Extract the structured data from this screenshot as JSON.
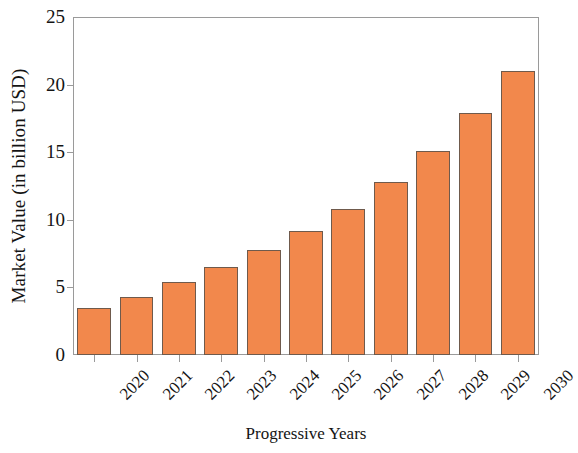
{
  "chart_data": {
    "type": "bar",
    "title": "",
    "xlabel": "Progressive Years",
    "ylabel": "Market Value (in billion USD)",
    "categories": [
      "2020",
      "2021",
      "2022",
      "2023",
      "2024",
      "2025",
      "2026",
      "2027",
      "2028",
      "2029",
      "2030"
    ],
    "values": [
      3.5,
      4.3,
      5.4,
      6.5,
      7.8,
      9.2,
      10.8,
      12.8,
      15.1,
      17.9,
      21.0
    ],
    "ylim": [
      0,
      25
    ],
    "yticks": [
      "0",
      "5",
      "10",
      "15",
      "20",
      "25"
    ],
    "ytick_values": [
      0,
      5,
      10,
      15,
      20,
      25
    ],
    "grid": false,
    "legend": "none",
    "bar_color": "#f2884c",
    "bar_edge_color": "#6f5a4c",
    "axis_color": "#9a9a9a"
  }
}
